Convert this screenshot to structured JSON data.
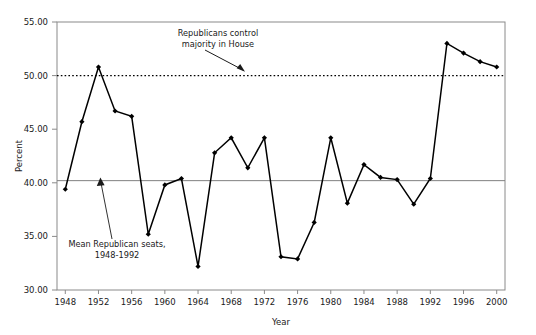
{
  "chart_data": {
    "type": "line",
    "title": "",
    "xlabel": "Year",
    "ylabel": "Percent",
    "xlim": [
      1947,
      2001
    ],
    "ylim": [
      30.0,
      55.0
    ],
    "yticks": [
      "30.00",
      "35.00",
      "40.00",
      "45.00",
      "50.00",
      "55.00"
    ],
    "ytick_values": [
      30,
      35,
      40,
      45,
      50,
      55
    ],
    "xticks": [
      "1948",
      "1952",
      "1956",
      "1960",
      "1964",
      "1968",
      "1972",
      "1976",
      "1980",
      "1984",
      "1988",
      "1992",
      "1996",
      "2000"
    ],
    "xtick_values": [
      1948,
      1952,
      1956,
      1960,
      1964,
      1968,
      1972,
      1976,
      1980,
      1984,
      1988,
      1992,
      1996,
      2000
    ],
    "grid": false,
    "legend": "none",
    "x": [
      1948,
      1950,
      1952,
      1954,
      1956,
      1958,
      1960,
      1962,
      1964,
      1966,
      1968,
      1970,
      1972,
      1974,
      1976,
      1978,
      1980,
      1982,
      1984,
      1986,
      1988,
      1990,
      1992,
      1994,
      1996,
      1998,
      2000
    ],
    "values": [
      39.4,
      45.7,
      50.8,
      46.7,
      46.2,
      35.2,
      39.8,
      40.4,
      32.2,
      42.8,
      44.2,
      41.4,
      44.2,
      33.1,
      32.9,
      36.3,
      44.2,
      38.1,
      41.7,
      40.5,
      40.3,
      38.0,
      40.4,
      53.0,
      52.1,
      51.3,
      50.8
    ],
    "series": [
      {
        "name": "Republican seats in House",
        "values": [
          39.4,
          45.7,
          50.8,
          46.7,
          46.2,
          35.2,
          39.8,
          40.4,
          32.2,
          42.8,
          44.2,
          41.4,
          44.2,
          33.1,
          32.9,
          36.3,
          44.2,
          38.1,
          41.7,
          40.5,
          40.3,
          38.0,
          40.4,
          53.0,
          52.1,
          51.3,
          50.8
        ],
        "color": "#000000",
        "marker": "diamond"
      }
    ],
    "reference_lines": [
      {
        "name": "majority-line",
        "value": 50.0,
        "style": "dotted",
        "color": "#000000",
        "label": "Republicans control majority in House"
      },
      {
        "name": "mean-line",
        "value": 40.2,
        "style": "solid",
        "color": "#808080",
        "label": "Mean Republican seats, 1948-1992"
      }
    ],
    "annotations": [
      {
        "name": "majority-annotation",
        "line1": "Republicans control",
        "line2": "majority in House",
        "arrow_from": [
          1975.0,
          54.2
        ],
        "arrow_to": [
          1979.0,
          50.6
        ]
      },
      {
        "name": "mean-annotation",
        "line1": "Mean Republican seats,",
        "line2": "1948-1992",
        "arrow_from": [
          1956.5,
          33.6
        ],
        "arrow_to": [
          1952.8,
          40.5
        ]
      }
    ],
    "colors": {
      "line": "#000000",
      "marker": "#000000",
      "axis": "#7a7a7a",
      "mean_line": "#808080",
      "majority_line": "#000000",
      "text": "#1a1a1a",
      "background": "#ffffff"
    }
  }
}
